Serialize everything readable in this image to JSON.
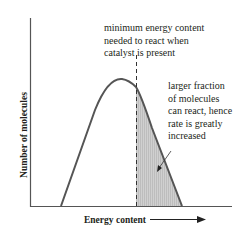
{
  "diagram": {
    "type": "energy distribution curve",
    "annotation_top": [
      "minimum energy content",
      "needed to react when",
      "catalyst is present"
    ],
    "annotation_side": [
      "larger fraction",
      "of molecules",
      "can react, hence",
      "rate is greatly",
      "increased"
    ],
    "x_axis_label": "Energy content",
    "y_axis_label": "Number of molecules",
    "colors": {
      "curve": "#555555",
      "axes": "#555555",
      "shaded_area": "#c8c8c8",
      "text": "#231f20"
    }
  }
}
